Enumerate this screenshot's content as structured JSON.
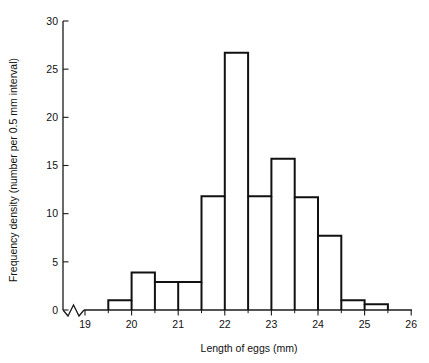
{
  "chart_data": {
    "type": "bar",
    "title": "",
    "xlabel": "Length of eggs (mm)",
    "ylabel": "Frequency density (number per 0.5 mm interval)",
    "xlim": [
      18.7,
      26
    ],
    "ylim": [
      0,
      30
    ],
    "grid": false,
    "legend": null,
    "axis_break_x": true,
    "bin_width": 0.5,
    "x_ticks": [
      "19",
      "20",
      "21",
      "22",
      "23",
      "24",
      "25",
      "26"
    ],
    "x_tick_values": [
      19,
      20,
      21,
      22,
      23,
      24,
      25,
      26
    ],
    "x_minor_ticks": [
      19.5,
      20.5,
      21.5,
      22.5,
      23.5,
      24.5,
      25.5
    ],
    "y_ticks": [
      "0",
      "5",
      "10",
      "15",
      "20",
      "25",
      "30"
    ],
    "y_tick_values": [
      0,
      5,
      10,
      15,
      20,
      25,
      30
    ],
    "bins": [
      {
        "start": 19.5,
        "end": 20.0,
        "value": 1.0
      },
      {
        "start": 20.0,
        "end": 20.5,
        "value": 3.9
      },
      {
        "start": 20.5,
        "end": 21.0,
        "value": 2.9
      },
      {
        "start": 21.0,
        "end": 21.5,
        "value": 2.9
      },
      {
        "start": 21.5,
        "end": 22.0,
        "value": 11.8
      },
      {
        "start": 22.0,
        "end": 22.5,
        "value": 26.7
      },
      {
        "start": 22.5,
        "end": 23.0,
        "value": 11.8
      },
      {
        "start": 23.0,
        "end": 23.5,
        "value": 15.7
      },
      {
        "start": 23.5,
        "end": 24.0,
        "value": 11.7
      },
      {
        "start": 24.0,
        "end": 24.5,
        "value": 7.7
      },
      {
        "start": 24.5,
        "end": 25.0,
        "value": 1.0
      },
      {
        "start": 25.0,
        "end": 25.5,
        "value": 0.6
      }
    ],
    "categories": [
      "19.5-20.0",
      "20.0-20.5",
      "20.5-21.0",
      "21.0-21.5",
      "21.5-22.0",
      "22.0-22.5",
      "22.5-23.0",
      "23.0-23.5",
      "23.5-24.0",
      "24.0-24.5",
      "24.5-25.0",
      "25.0-25.5"
    ],
    "values": [
      1.0,
      3.9,
      2.9,
      2.9,
      11.8,
      26.7,
      11.8,
      15.7,
      11.7,
      7.7,
      1.0,
      0.6
    ]
  },
  "colors": {
    "bar_stroke": "#111111",
    "axis": "#1a1a1a",
    "background": "#ffffff"
  }
}
